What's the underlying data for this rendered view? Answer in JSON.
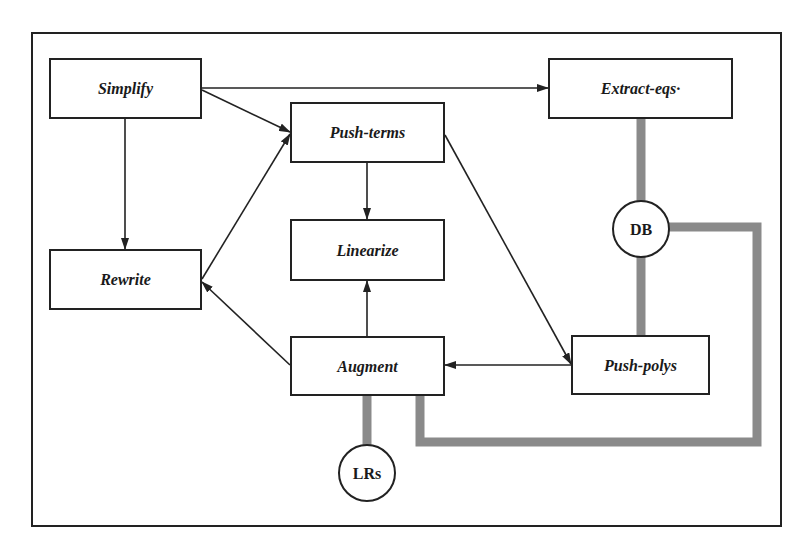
{
  "diagram": {
    "type": "flowchart",
    "frame": {
      "x": 32,
      "y": 33,
      "width": 749,
      "height": 493
    },
    "colors": {
      "line": "#222222",
      "data_link": "#8a8a8a",
      "background": "#ffffff"
    },
    "nodes": {
      "simplify": {
        "label": "Simplify",
        "shape": "box"
      },
      "extract_eqs": {
        "label": "Extract-eqs·",
        "shape": "box"
      },
      "push_terms": {
        "label": "Push-terms",
        "shape": "box"
      },
      "linearize": {
        "label": "Linearize",
        "shape": "box"
      },
      "rewrite": {
        "label": "Rewrite",
        "shape": "box"
      },
      "augment": {
        "label": "Augment",
        "shape": "box"
      },
      "push_polys": {
        "label": "Push-polys",
        "shape": "box"
      },
      "db": {
        "label": "DB",
        "shape": "circle"
      },
      "lrs": {
        "label": "LRs",
        "shape": "circle"
      }
    },
    "edges": [
      {
        "from": "Simplify",
        "to": "Extract-eqs",
        "kind": "arrow"
      },
      {
        "from": "Simplify",
        "to": "Push-terms",
        "kind": "arrow"
      },
      {
        "from": "Simplify",
        "to": "Rewrite",
        "kind": "arrow"
      },
      {
        "from": "Rewrite",
        "to": "Push-terms",
        "kind": "arrow"
      },
      {
        "from": "Push-terms",
        "to": "Linearize",
        "kind": "arrow"
      },
      {
        "from": "Push-terms",
        "to": "Push-polys",
        "kind": "arrow"
      },
      {
        "from": "Augment",
        "to": "Linearize",
        "kind": "arrow"
      },
      {
        "from": "Augment",
        "to": "Rewrite",
        "kind": "arrow"
      },
      {
        "from": "Push-polys",
        "to": "Augment",
        "kind": "arrow"
      }
    ],
    "data_links": [
      {
        "from": "Extract-eqs",
        "to": "DB"
      },
      {
        "from": "DB",
        "to": "Push-polys"
      },
      {
        "from": "DB",
        "to": "Augment"
      },
      {
        "from": "Augment",
        "to": "LRs"
      }
    ]
  }
}
